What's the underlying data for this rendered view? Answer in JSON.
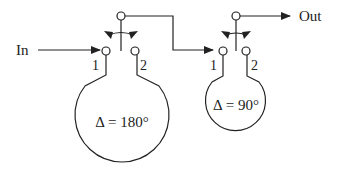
{
  "diagram": {
    "input_label": "In",
    "output_label": "Out",
    "stages": [
      {
        "id": "stage-1",
        "port_1_label": "1",
        "port_2_label": "2",
        "phase_label": "Δ = 180°"
      },
      {
        "id": "stage-2",
        "port_1_label": "1",
        "port_2_label": "2",
        "phase_label": "Δ = 90°"
      }
    ],
    "colors": {
      "line": "#222222",
      "background": "#ffffff"
    }
  }
}
